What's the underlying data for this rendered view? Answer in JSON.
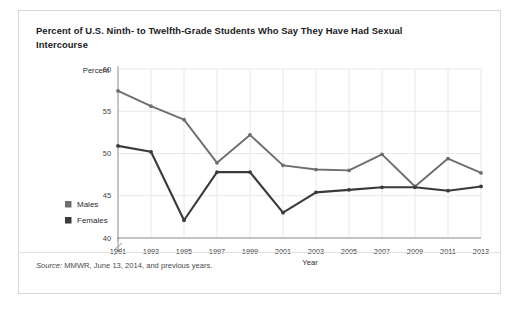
{
  "title": "Percent of U.S. Ninth- to Twelfth-Grade Students Who Say They Have Had Sexual Intercourse",
  "source": {
    "label": "Source:",
    "text": " MMWR, June 13, 2014, and previous years."
  },
  "legend": [
    {
      "label": "Males",
      "color": "#6e6e6e",
      "marker": "square"
    },
    {
      "label": "Females",
      "color": "#3a3a3a",
      "marker": "square"
    }
  ],
  "axis": {
    "y_title": "Percent",
    "x_title": "Year",
    "y_ticks": [
      "60",
      "55",
      "50",
      "45",
      "40"
    ],
    "y_break": true
  },
  "chart_data": {
    "type": "line",
    "title": "Percent of U.S. Ninth- to Twelfth-Grade Students Who Say They Have Had Sexual Intercourse",
    "xlabel": "Year",
    "ylabel": "Percent",
    "ylim": [
      40,
      60
    ],
    "ytick_values": [
      40,
      45,
      50,
      55,
      60
    ],
    "axis_break_below": 40,
    "grid": true,
    "legend_position": "left-outside",
    "categories": [
      1991,
      1993,
      1995,
      1997,
      1999,
      2001,
      2003,
      2005,
      2007,
      2009,
      2011,
      2013
    ],
    "series": [
      {
        "name": "Males",
        "color": "#6e6e6e",
        "values": [
          57.4,
          55.6,
          54.0,
          48.9,
          52.2,
          48.6,
          48.1,
          48.0,
          49.9,
          46.1,
          49.4,
          47.7
        ]
      },
      {
        "name": "Females",
        "color": "#3a3a3a",
        "values": [
          50.9,
          50.2,
          42.1,
          47.8,
          47.8,
          43.0,
          45.4,
          45.7,
          46.0,
          46.0,
          45.6,
          46.1
        ]
      }
    ]
  }
}
